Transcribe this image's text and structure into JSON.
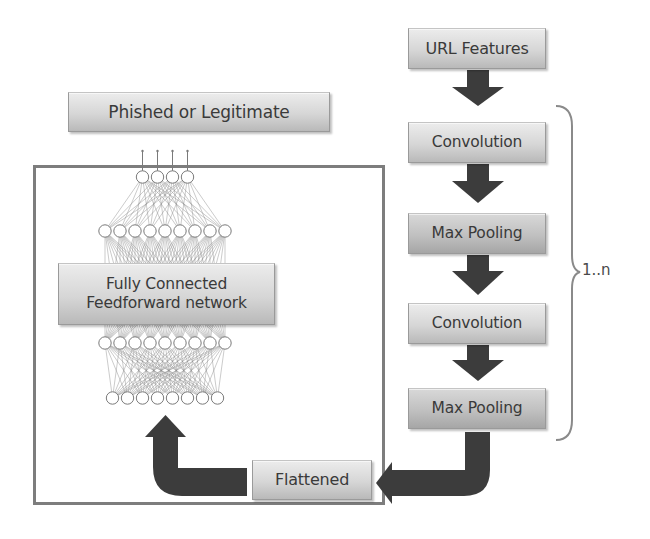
{
  "diagram": {
    "pipeline": {
      "input_label": "URL Features",
      "stages": [
        {
          "label": "Convolution"
        },
        {
          "label": "Max Pooling"
        },
        {
          "label": "Convolution"
        },
        {
          "label": "Max Pooling"
        }
      ],
      "repeat_label": "1..n",
      "flatten_label": "Flattened"
    },
    "classifier": {
      "network_label_line1": "Fully Connected",
      "network_label_line2": "Feedforward network",
      "output_label": "Phished or Legitimate",
      "layers_node_counts": [
        4,
        9,
        9,
        8
      ]
    },
    "colors": {
      "arrow": "#3c3c3c",
      "frame": "#7d7d7d",
      "box_top": "#ececec",
      "box_bottom": "#b9b9b9",
      "text": "#3a3a3a"
    }
  }
}
